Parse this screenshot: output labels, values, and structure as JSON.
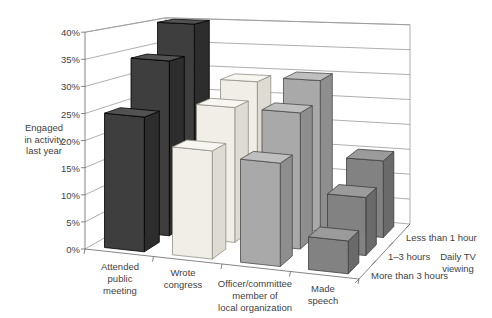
{
  "chart_data": {
    "type": "bar",
    "projection": "3d-column",
    "title": "",
    "value_axis": {
      "label": "Engaged in activity last year",
      "label_lines": [
        "Engaged",
        "in activity",
        "last year"
      ],
      "min": 0,
      "max": 40,
      "step": 5,
      "unit": "%",
      "tick_labels": [
        "0%",
        "5%",
        "10%",
        "15%",
        "20%",
        "25%",
        "30%",
        "35%",
        "40%"
      ]
    },
    "category_axis": {
      "categories": [
        "Attended public meeting",
        "Wrote congress",
        "Officer/committee member of local organization",
        "Made speech"
      ],
      "label_lines": [
        [
          "Attended",
          "public",
          "meeting"
        ],
        [
          "Wrote",
          "congress"
        ],
        [
          "Officer/committee",
          "member of",
          "local organization"
        ],
        [
          "Made",
          "speech"
        ]
      ]
    },
    "depth_axis": {
      "title": "Daily TV viewing",
      "title_lines": [
        "Daily TV",
        "viewing"
      ],
      "labels": [
        "Less than 1 hour",
        "1–3 hours",
        "More than 3 hours"
      ]
    },
    "series": [
      {
        "name": "Less than 1 hour",
        "depth": "back",
        "values": [
          40,
          29,
          30,
          15
        ]
      },
      {
        "name": "1–3 hours",
        "depth": "middle",
        "values": [
          34,
          26,
          26,
          11
        ]
      },
      {
        "name": "More than 3 hours",
        "depth": "front",
        "values": [
          25,
          20,
          19,
          6
        ]
      }
    ],
    "category_colors": [
      {
        "category": "Attended public meeting",
        "front": "#3e3e3e",
        "side": "#2d2d2d",
        "top": "#525252",
        "edge": "#000000"
      },
      {
        "category": "Wrote congress",
        "front": "#f0eee6",
        "side": "#dedcd2",
        "top": "#f7f6f0",
        "edge": "#8f8f86"
      },
      {
        "category": "Officer/committee member of local organization",
        "front": "#a9a9a9",
        "side": "#8e8e8e",
        "top": "#bfbfbf",
        "edge": "#4a4a4a"
      },
      {
        "category": "Made speech",
        "front": "#828282",
        "side": "#6a6a6a",
        "top": "#9b9b9b",
        "edge": "#3d3d3d"
      }
    ],
    "grid": {
      "line_color": "#999999",
      "axis_color": "#666666",
      "background": "#ffffff"
    },
    "legend_position": "none"
  }
}
